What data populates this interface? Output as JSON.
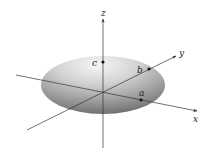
{
  "diagram": {
    "type": "ellipsoid-3d-axes",
    "axes": [
      {
        "name": "x",
        "label": "x"
      },
      {
        "name": "y",
        "label": "y"
      },
      {
        "name": "z",
        "label": "z"
      }
    ],
    "points": [
      {
        "name": "a",
        "label": "a",
        "on_axis": "x"
      },
      {
        "name": "b",
        "label": "b",
        "on_axis": "y"
      },
      {
        "name": "c",
        "label": "c",
        "on_axis": "z"
      }
    ],
    "colors": {
      "surface_light": "#f2f2f2",
      "surface_dark": "#6e6e6e",
      "axis": "#333333"
    }
  }
}
